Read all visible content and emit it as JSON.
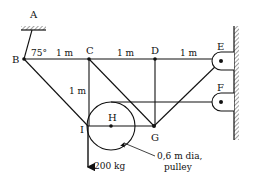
{
  "diagram": {
    "type": "truss-with-pulley",
    "nodes": {
      "A": "A",
      "B": "B",
      "C": "C",
      "D": "D",
      "E": "E",
      "F": "F",
      "G": "G",
      "H": "H",
      "I": "I"
    },
    "angle_label": "75°",
    "dimensions": {
      "BC": "1 m",
      "CD": "1 m",
      "DE": "1 m",
      "CI": "1 m"
    },
    "load_label": "200 kg",
    "pulley_note_line1": "0,6 m dia,",
    "pulley_note_line2": "pulley",
    "colors": {
      "ink": "#111111",
      "background": "#ffffff"
    }
  }
}
